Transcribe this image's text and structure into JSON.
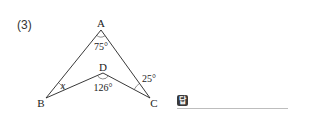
{
  "problem": {
    "number": "(3)"
  },
  "figure": {
    "vertices": {
      "A": {
        "label": "A",
        "x": 101,
        "y": 30
      },
      "B": {
        "label": "B",
        "x": 46,
        "y": 98
      },
      "C": {
        "label": "C",
        "x": 150,
        "y": 98
      },
      "D": {
        "label": "D",
        "x": 103,
        "y": 73
      }
    },
    "angles": {
      "A": "75°",
      "D": "126°",
      "C": "25°",
      "B": "x"
    },
    "line_color": "#222222",
    "text_color": "#222222"
  },
  "answer": {
    "badge": "답",
    "value": ""
  }
}
